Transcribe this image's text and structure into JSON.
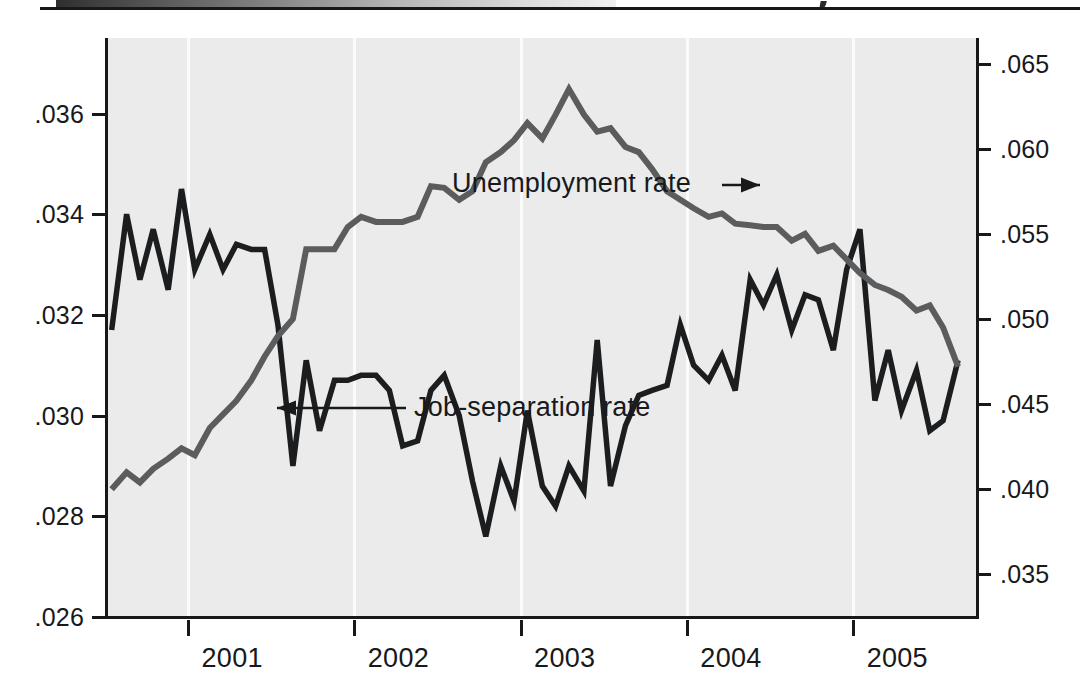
{
  "figure": {
    "scan_artifact": "top-gradient-strip-and-rule",
    "background_color": "#ebebeb",
    "frame_color": "#16181a"
  },
  "annotations": [
    {
      "name": "unemployment-rate",
      "label": "Unemployment rate",
      "arrow": "right",
      "target_x": 760,
      "target_y": 185
    },
    {
      "name": "job-separation-rate",
      "label": "Job-separation rate",
      "arrow": "left",
      "target_x": 277,
      "target_y": 408
    }
  ],
  "chart_data": {
    "type": "line",
    "title": "",
    "subtitle": "",
    "xlabel": "",
    "ylabel": "",
    "grid": "vertical-year-gridlines",
    "legend": "inline-annotations-with-arrows",
    "xlim": [
      2000.5,
      2005.75
    ],
    "x_tick_labels": [
      "2001",
      "2002",
      "2003",
      "2004",
      "2005"
    ],
    "x_tick_values": [
      2001,
      2002,
      2003,
      2004,
      2005
    ],
    "axes": [
      {
        "name": "left-axis",
        "series": "Job-separation rate",
        "ylim": [
          0.026,
          0.0375
        ],
        "tick_labels": [
          ".036",
          ".034",
          ".032",
          ".030",
          ".028",
          ".026"
        ],
        "tick_values": [
          0.036,
          0.034,
          0.032,
          0.03,
          0.028,
          0.026
        ]
      },
      {
        "name": "right-axis",
        "series": "Unemployment rate",
        "ylim": [
          0.0325,
          0.0665
        ],
        "tick_labels": [
          ".065",
          ".060",
          ".055",
          ".050",
          ".045",
          ".040",
          ".035"
        ],
        "tick_values": [
          0.065,
          0.06,
          0.055,
          0.05,
          0.045,
          0.04,
          0.035
        ]
      }
    ],
    "series": [
      {
        "name": "Job-separation rate",
        "axis": "left",
        "color": "#1b1d1f",
        "line_width": 5.5,
        "x": [
          2000.54,
          2000.63,
          2000.71,
          2000.79,
          2000.88,
          2000.96,
          2001.04,
          2001.13,
          2001.21,
          2001.29,
          2001.38,
          2001.46,
          2001.54,
          2001.63,
          2001.71,
          2001.79,
          2001.88,
          2001.96,
          2002.04,
          2002.13,
          2002.21,
          2002.29,
          2002.38,
          2002.46,
          2002.54,
          2002.63,
          2002.71,
          2002.79,
          2002.88,
          2002.96,
          2003.04,
          2003.13,
          2003.21,
          2003.29,
          2003.38,
          2003.46,
          2003.54,
          2003.63,
          2003.71,
          2003.79,
          2003.88,
          2003.96,
          2004.04,
          2004.13,
          2004.21,
          2004.29,
          2004.38,
          2004.46,
          2004.54,
          2004.63,
          2004.71,
          2004.79,
          2004.88,
          2004.96,
          2005.04,
          2005.13,
          2005.21,
          2005.29,
          2005.38,
          2005.46,
          2005.54,
          2005.63
        ],
        "values": [
          0.0317,
          0.034,
          0.0327,
          0.0337,
          0.0325,
          0.0345,
          0.0329,
          0.0336,
          0.0329,
          0.0334,
          0.0333,
          0.0333,
          0.0318,
          0.029,
          0.0311,
          0.0297,
          0.0307,
          0.0307,
          0.0308,
          0.0308,
          0.0305,
          0.0294,
          0.0295,
          0.0305,
          0.0308,
          0.03,
          0.0287,
          0.0276,
          0.029,
          0.0283,
          0.0301,
          0.0286,
          0.0282,
          0.029,
          0.0285,
          0.0315,
          0.0286,
          0.0298,
          0.0304,
          0.0305,
          0.0306,
          0.0318,
          0.031,
          0.0307,
          0.0312,
          0.0305,
          0.0327,
          0.0322,
          0.0328,
          0.0317,
          0.0324,
          0.0323,
          0.0313,
          0.0329,
          0.0337,
          0.0303,
          0.0313,
          0.0301,
          0.0309,
          0.0297,
          0.0299,
          0.0311
        ]
      },
      {
        "name": "Unemployment rate",
        "axis": "right",
        "color": "#5a5c5e",
        "line_width": 6.0,
        "x": [
          2000.54,
          2000.63,
          2000.71,
          2000.79,
          2000.88,
          2000.96,
          2001.04,
          2001.13,
          2001.21,
          2001.29,
          2001.38,
          2001.46,
          2001.54,
          2001.63,
          2001.71,
          2001.79,
          2001.88,
          2001.96,
          2002.04,
          2002.13,
          2002.21,
          2002.29,
          2002.38,
          2002.46,
          2002.54,
          2002.63,
          2002.71,
          2002.79,
          2002.88,
          2002.96,
          2003.04,
          2003.13,
          2003.21,
          2003.29,
          2003.38,
          2003.46,
          2003.54,
          2003.63,
          2003.71,
          2003.79,
          2003.88,
          2003.96,
          2004.04,
          2004.13,
          2004.21,
          2004.29,
          2004.38,
          2004.46,
          2004.54,
          2004.63,
          2004.71,
          2004.79,
          2004.88,
          2004.96,
          2005.04,
          2005.13,
          2005.21,
          2005.29,
          2005.38,
          2005.46,
          2005.54,
          2005.63
        ],
        "values": [
          0.04,
          0.041,
          0.0404,
          0.0412,
          0.0418,
          0.0424,
          0.042,
          0.0436,
          0.0444,
          0.0452,
          0.0464,
          0.0478,
          0.049,
          0.05,
          0.0541,
          0.0541,
          0.0541,
          0.0554,
          0.056,
          0.0557,
          0.0557,
          0.0557,
          0.056,
          0.0578,
          0.0577,
          0.057,
          0.0575,
          0.0592,
          0.0598,
          0.0605,
          0.0615,
          0.0606,
          0.062,
          0.0635,
          0.062,
          0.061,
          0.0612,
          0.0601,
          0.0598,
          0.0588,
          0.0575,
          0.057,
          0.0565,
          0.056,
          0.0562,
          0.0556,
          0.0555,
          0.0554,
          0.0554,
          0.0546,
          0.055,
          0.054,
          0.0543,
          0.0535,
          0.0527,
          0.052,
          0.0517,
          0.0513,
          0.0505,
          0.0508,
          0.0495,
          0.0472
        ]
      }
    ]
  }
}
